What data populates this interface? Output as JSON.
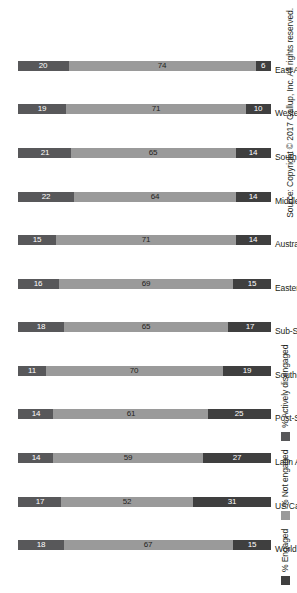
{
  "chart_data": {
    "type": "bar",
    "subtype": "stacked-bar-100",
    "orientation": "vertical-bars-rotated-90ccw",
    "title": "",
    "xlabel": "",
    "ylabel": "",
    "ylim": [
      0,
      100
    ],
    "grid": false,
    "legend_position": "left",
    "categories": [
      "World",
      "US/Canada",
      "Latin America/Caribbean",
      "Post-Soviet Eurasia",
      "Southeast Asia",
      "Sub-Saharan Africa",
      "Eastern Europe",
      "Australia/New Zealand",
      "Middle East/North Africa",
      "South Asia",
      "Western Europe",
      "East Asia"
    ],
    "series": [
      {
        "name": "% Engaged",
        "color": "#3f3f3f",
        "values": [
          15,
          31,
          27,
          25,
          19,
          17,
          15,
          14,
          14,
          14,
          10,
          6
        ]
      },
      {
        "name": "% Not engaged",
        "color": "#9a9a9a",
        "values": [
          67,
          52,
          59,
          61,
          70,
          65,
          69,
          71,
          64,
          65,
          71,
          74
        ]
      },
      {
        "name": "% Actively disengaged",
        "color": "#58585a",
        "values": [
          18,
          17,
          14,
          14,
          11,
          18,
          16,
          15,
          22,
          21,
          19,
          20
        ]
      }
    ],
    "source_note": "Source: Copyright © 2017 Gallup, Inc. All rights reserved."
  },
  "legend": {
    "items": [
      {
        "label": "% Engaged",
        "color": "#3f3f3f"
      },
      {
        "label": "% Not engaged",
        "color": "#9a9a9a"
      },
      {
        "label": "% Actively disengaged",
        "color": "#58585a"
      }
    ]
  },
  "footer": {
    "source": "Source: Copyright © 2017 Gallup, Inc. All rights reserved."
  }
}
